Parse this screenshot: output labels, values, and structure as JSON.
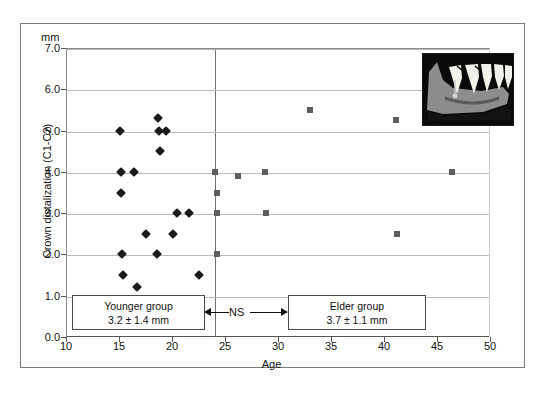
{
  "figure": {
    "unit_label": "mm",
    "y_axis_title": "Crown distalization (C1-C2)",
    "x_axis_title": "Age",
    "inset_name": "mandible-radiograph-illustration"
  },
  "annotations": {
    "younger": {
      "title": "Younger group",
      "stat": "3.2 ± 1.4 mm"
    },
    "elder": {
      "title": "Elder group",
      "stat": "3.7 ± 1.1 mm"
    },
    "significance": "NS"
  },
  "colors": {
    "younger_marker": "#1b1b1b",
    "elder_marker": "#5e5e5e",
    "gridline": "#b9b9b9",
    "axis": "#555555",
    "frame": "#7a7a7a",
    "inset_background": "#0a0a0a",
    "inset_bone": "#8c8c8c",
    "inset_tooth": "#f0f0ea"
  },
  "chart_data": {
    "type": "scatter",
    "title": "",
    "xlabel": "Age",
    "ylabel": "Crown distalization (C1-C2)",
    "yunit": "mm",
    "xlim": [
      10,
      50
    ],
    "ylim": [
      0.0,
      7.0
    ],
    "xticks": [
      10,
      15,
      20,
      25,
      30,
      35,
      40,
      45,
      50
    ],
    "yticks": [
      0.0,
      1.0,
      2.0,
      3.0,
      4.0,
      5.0,
      6.0,
      7.0
    ],
    "ytick_labels": [
      "0.0",
      "1.0",
      "2.0",
      "3.0",
      "4.0",
      "5.0",
      "6.0",
      "7.0"
    ],
    "xtick_labels": [
      "10",
      "15",
      "20",
      "25",
      "30",
      "35",
      "40",
      "45",
      "50"
    ],
    "grid": "horizontal",
    "legend": "none",
    "group_divider_x": 24,
    "series": [
      {
        "name": "Younger group",
        "marker": "diamond",
        "color": "#1b1b1b",
        "summary_mean": 3.2,
        "summary_sd": 1.4,
        "points": [
          {
            "x": 15.1,
            "y": 5.0
          },
          {
            "x": 15.2,
            "y": 4.0
          },
          {
            "x": 15.2,
            "y": 3.5
          },
          {
            "x": 15.3,
            "y": 2.0
          },
          {
            "x": 15.4,
            "y": 1.5
          },
          {
            "x": 16.4,
            "y": 4.0
          },
          {
            "x": 16.7,
            "y": 1.2
          },
          {
            "x": 17.5,
            "y": 2.5
          },
          {
            "x": 18.7,
            "y": 5.3
          },
          {
            "x": 18.8,
            "y": 5.0
          },
          {
            "x": 19.4,
            "y": 5.0
          },
          {
            "x": 18.9,
            "y": 4.5
          },
          {
            "x": 18.6,
            "y": 2.0
          },
          {
            "x": 20.5,
            "y": 3.0
          },
          {
            "x": 20.1,
            "y": 2.5
          },
          {
            "x": 21.6,
            "y": 3.0
          },
          {
            "x": 22.5,
            "y": 1.5
          }
        ]
      },
      {
        "name": "Elder group",
        "marker": "square",
        "color": "#5e5e5e",
        "summary_mean": 3.7,
        "summary_sd": 1.1,
        "points": [
          {
            "x": 24.1,
            "y": 4.0
          },
          {
            "x": 24.2,
            "y": 3.5
          },
          {
            "x": 24.2,
            "y": 3.0
          },
          {
            "x": 24.2,
            "y": 2.0
          },
          {
            "x": 26.2,
            "y": 3.9
          },
          {
            "x": 28.8,
            "y": 4.0
          },
          {
            "x": 28.9,
            "y": 3.0
          },
          {
            "x": 33.0,
            "y": 5.5
          },
          {
            "x": 41.1,
            "y": 5.25
          },
          {
            "x": 41.2,
            "y": 2.5
          },
          {
            "x": 46.4,
            "y": 4.0
          }
        ]
      }
    ]
  }
}
